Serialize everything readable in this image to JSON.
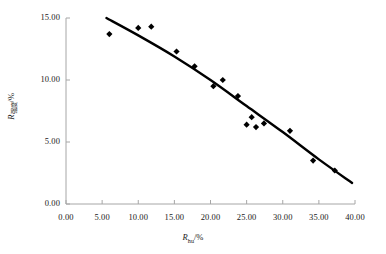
{
  "chart_data": {
    "type": "scatter",
    "title": "",
    "xlabel": "R_hu/%",
    "ylabel": "R_qiangdu/%",
    "xlabel_symbol": "R",
    "xlabel_subscript": "hu",
    "xlabel_unit": "/%",
    "ylabel_symbol": "R",
    "ylabel_subscript": "强度",
    "ylabel_unit": "/%",
    "xlim": [
      0,
      40
    ],
    "ylim": [
      0,
      15
    ],
    "xticks": [
      0,
      5,
      10,
      15,
      20,
      25,
      30,
      35,
      40
    ],
    "xtick_labels": [
      "0.00",
      "5.00",
      "10.00",
      "15.00",
      "20.00",
      "25.00",
      "30.00",
      "35.00",
      "40.00"
    ],
    "yticks": [
      0,
      5,
      10,
      15
    ],
    "ytick_labels": [
      "0.00",
      "5.00",
      "10.00",
      "15.00"
    ],
    "grid": false,
    "legend": false,
    "marker": "diamond",
    "marker_color": "#000000",
    "line_color": "#000000",
    "axis_color": "#a6a6a6",
    "points": [
      {
        "x": 6.0,
        "y": 13.7
      },
      {
        "x": 10.0,
        "y": 14.2
      },
      {
        "x": 11.8,
        "y": 14.3
      },
      {
        "x": 15.3,
        "y": 12.3
      },
      {
        "x": 17.8,
        "y": 11.1
      },
      {
        "x": 20.4,
        "y": 9.5
      },
      {
        "x": 21.7,
        "y": 10.0
      },
      {
        "x": 23.8,
        "y": 8.7
      },
      {
        "x": 25.0,
        "y": 6.4
      },
      {
        "x": 25.7,
        "y": 7.0
      },
      {
        "x": 26.3,
        "y": 6.2
      },
      {
        "x": 27.4,
        "y": 6.5
      },
      {
        "x": 31.0,
        "y": 5.9
      },
      {
        "x": 34.2,
        "y": 3.5
      },
      {
        "x": 37.2,
        "y": 2.7
      }
    ],
    "trend_curve": [
      {
        "x": 5.6,
        "y": 15.0
      },
      {
        "x": 10.0,
        "y": 13.6
      },
      {
        "x": 15.0,
        "y": 11.9
      },
      {
        "x": 20.0,
        "y": 10.0
      },
      {
        "x": 25.0,
        "y": 7.9
      },
      {
        "x": 30.0,
        "y": 5.8
      },
      {
        "x": 35.0,
        "y": 3.6
      },
      {
        "x": 39.6,
        "y": 1.7
      }
    ]
  }
}
